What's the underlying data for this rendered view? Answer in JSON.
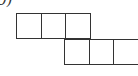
{
  "label": "д)",
  "diagram": {
    "type": "cube-net",
    "stroke_color": "#333333",
    "cell_size": 24.5,
    "cells": [
      {
        "row": 0,
        "col": 0,
        "x": 16,
        "y": 13
      },
      {
        "row": 0,
        "col": 1,
        "x": 40.5,
        "y": 13
      },
      {
        "row": 0,
        "col": 2,
        "x": 65,
        "y": 13
      },
      {
        "row": 1,
        "col": 2,
        "x": 64,
        "y": 39
      },
      {
        "row": 1,
        "col": 3,
        "x": 88.5,
        "y": 39
      },
      {
        "row": 1,
        "col": 4,
        "x": 113,
        "y": 39
      }
    ]
  }
}
